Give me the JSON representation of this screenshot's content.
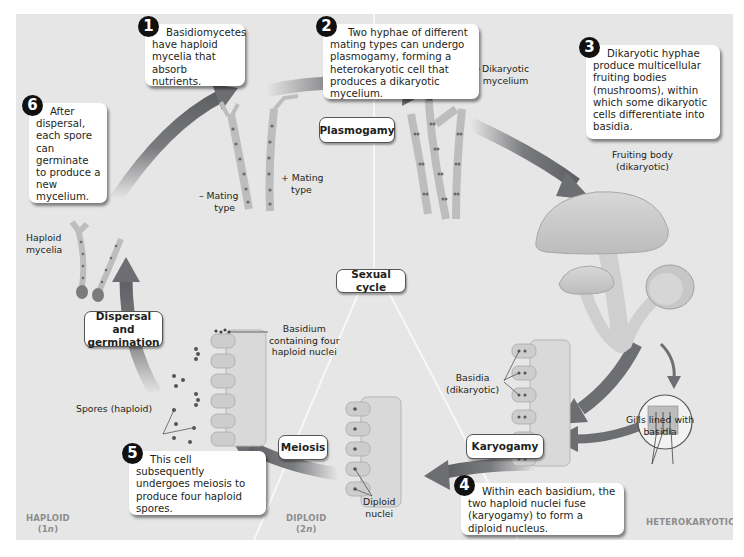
{
  "diagram": {
    "type": "life-cycle",
    "center_label": "Sexual cycle",
    "steps": [
      {
        "number": "1",
        "text": "Basidiomycetes have haploid mycelia that absorb nutrients."
      },
      {
        "number": "2",
        "text": "Two hyphae of different mating types can undergo plasmogamy, forming a heterokaryotic cell that produces a dikaryotic mycelium."
      },
      {
        "number": "3",
        "text": "Dikaryotic hyphae produce multicellular fruiting bodies (mushrooms), within which some dikaryotic cells differentiate into basidia."
      },
      {
        "number": "4",
        "text": "Within each basidium, the two haploid nuclei fuse (karyogamy) to form a diploid nucleus."
      },
      {
        "number": "5",
        "text": "This cell subsequently undergoes meiosis to produce four haploid spores."
      },
      {
        "number": "6",
        "text": "After dispersal, each spore can germinate to produce a new mycelium."
      }
    ],
    "processes": {
      "plasmogamy": "Plasmogamy",
      "karyogamy": "Karyogamy",
      "meiosis": "Meiosis",
      "dispersal_line1": "Dispersal and",
      "dispersal_line2": "germination"
    },
    "labels": {
      "minus_mating_1": "– Mating",
      "minus_mating_2": "type",
      "plus_mating_1": "+ Mating",
      "plus_mating_2": "type",
      "dikaryotic_mycelium_1": "Dikaryotic",
      "dikaryotic_mycelium_2": "mycelium",
      "fruiting_body_1": "Fruiting body",
      "fruiting_body_2": "(dikaryotic)",
      "gills_1": "Gills lined with",
      "gills_2": "basidia",
      "basidia_1": "Basidia",
      "basidia_2": "(dikaryotic)",
      "diploid_nuclei_1": "Diploid",
      "diploid_nuclei_2": "nuclei",
      "basidium_four_1": "Basidium",
      "basidium_four_2": "containing four",
      "basidium_four_3": "haploid nuclei",
      "spores": "Spores (haploid)",
      "haploid_mycelia_1": "Haploid",
      "haploid_mycelia_2": "mycelia"
    },
    "regions": {
      "haploid": "HAPLOID",
      "haploid_ploidy_pre": "(1",
      "haploid_ploidy_n": "n",
      "haploid_ploidy_post": ")",
      "diploid": "DIPLOID",
      "diploid_ploidy_pre": "(2",
      "diploid_ploidy_n": "n",
      "diploid_ploidy_post": ")",
      "heterokaryotic": "HETEROKARYOTIC"
    },
    "colors": {
      "background": "#e6e6e6",
      "arrow": "#6d6e71",
      "callout_number": "#111111",
      "region_label": "#8d8d8d"
    }
  }
}
